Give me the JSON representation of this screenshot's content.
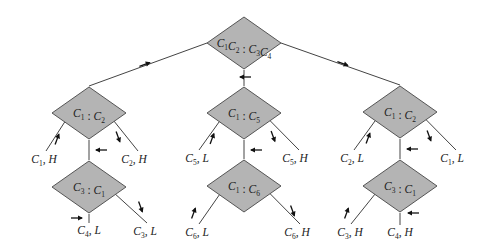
{
  "diagram": {
    "type": "decision-tree",
    "colors": {
      "node_fill": "#b4b4b4",
      "node_stroke": "#555555",
      "edge": "#444444",
      "text": "#222222"
    },
    "nodes": [
      {
        "id": "root",
        "label": "C1C2 : C3C4",
        "parts": [
          [
            "C",
            "1"
          ],
          [
            "C",
            "2"
          ],
          [
            " : ",
            ""
          ],
          [
            "C",
            "3"
          ],
          [
            "C",
            "4"
          ]
        ]
      },
      {
        "id": "L",
        "label": "C1 : C2",
        "parts": [
          [
            "C",
            "1"
          ],
          [
            " : ",
            ""
          ],
          [
            "C",
            "2"
          ]
        ]
      },
      {
        "id": "M",
        "label": "C1 : C5",
        "parts": [
          [
            "C",
            "1"
          ],
          [
            " : ",
            ""
          ],
          [
            "C",
            "5"
          ]
        ]
      },
      {
        "id": "R",
        "label": "C1 : C2",
        "parts": [
          [
            "C",
            "1"
          ],
          [
            " : ",
            ""
          ],
          [
            "C",
            "2"
          ]
        ]
      },
      {
        "id": "LB",
        "label": "C3 : C1",
        "parts": [
          [
            "C",
            "3"
          ],
          [
            " : ",
            ""
          ],
          [
            "C",
            "1"
          ]
        ]
      },
      {
        "id": "MB",
        "label": "C1 : C6",
        "parts": [
          [
            "C",
            "1"
          ],
          [
            " : ",
            ""
          ],
          [
            "C",
            "6"
          ]
        ]
      },
      {
        "id": "RB",
        "label": "C3 : C1",
        "parts": [
          [
            "C",
            "3"
          ],
          [
            " : ",
            ""
          ],
          [
            "C",
            "1"
          ]
        ]
      }
    ],
    "leaves": [
      {
        "id": "l1",
        "coin": "1",
        "weight": "H",
        "label": "C1, H"
      },
      {
        "id": "l2",
        "coin": "2",
        "weight": "H",
        "label": "C2, H"
      },
      {
        "id": "l3",
        "coin": "4",
        "weight": "L",
        "label": "C4, L"
      },
      {
        "id": "l4",
        "coin": "3",
        "weight": "L",
        "label": "C3, L"
      },
      {
        "id": "l5",
        "coin": "5",
        "weight": "L",
        "label": "C5, L"
      },
      {
        "id": "l6",
        "coin": "5",
        "weight": "H",
        "label": "C5, H"
      },
      {
        "id": "l7",
        "coin": "6",
        "weight": "L",
        "label": "C6, L"
      },
      {
        "id": "l8",
        "coin": "6",
        "weight": "H",
        "label": "C6, H"
      },
      {
        "id": "l9",
        "coin": "2",
        "weight": "L",
        "label": "C2, L"
      },
      {
        "id": "l10",
        "coin": "1",
        "weight": "L",
        "label": "C1, L"
      },
      {
        "id": "l11",
        "coin": "3",
        "weight": "H",
        "label": "C3, H"
      },
      {
        "id": "l12",
        "coin": "4",
        "weight": "H",
        "label": "C4, H"
      }
    ]
  }
}
